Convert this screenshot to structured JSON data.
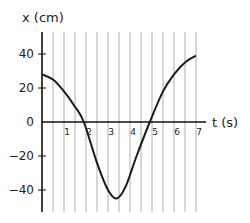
{
  "chart_data": {
    "type": "line",
    "title": "",
    "xlabel": "t (s)",
    "ylabel": "x (cm)",
    "xlim": [
      0,
      7
    ],
    "ylim": [
      -50,
      50
    ],
    "x_ticks": [
      1,
      2,
      3,
      4,
      5,
      6,
      7
    ],
    "x_tick_labels": [
      "1",
      "2",
      "3",
      "4",
      "5",
      "6",
      "7"
    ],
    "y_ticks": [
      40,
      20,
      0,
      -20,
      -40
    ],
    "y_tick_labels": [
      "40",
      "20",
      "0",
      "−20",
      "−40"
    ],
    "grid": {
      "vertical": true,
      "horizontal": false,
      "vertical_step": 0.5
    },
    "legend": null,
    "series": [
      {
        "name": "x(t)",
        "x": [
          0,
          0.5,
          1.0,
          1.5,
          1.9,
          2.5,
          3.0,
          3.4,
          3.8,
          4.3,
          4.9,
          5.5,
          6.0,
          6.5,
          7.0
        ],
        "values": [
          28,
          25,
          18,
          9,
          0,
          -24,
          -40,
          -45,
          -38,
          -20,
          0,
          18,
          28,
          35,
          39
        ]
      }
    ]
  },
  "labels": {
    "y_axis_title": "x (cm)",
    "x_axis_title": "t (s)",
    "y_ticks": [
      "40",
      "20",
      "0",
      "−20",
      "−40"
    ],
    "x_ticks": [
      "1",
      "2",
      "3",
      "4",
      "5",
      "6",
      "7"
    ]
  }
}
